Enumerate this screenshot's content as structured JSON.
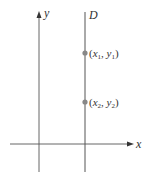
{
  "diagram": {
    "axes": {
      "x_label": "x",
      "y_label": "y"
    },
    "line": {
      "label": "D",
      "type": "vertical"
    },
    "points": [
      {
        "x_sym": "x",
        "x_sub": "1",
        "y_sym": "y",
        "y_sub": "1"
      },
      {
        "x_sym": "x",
        "x_sub": "2",
        "y_sym": "y",
        "y_sub": "2"
      }
    ],
    "colors": {
      "line": "#555555",
      "point": "#888888",
      "text": "#333333"
    }
  }
}
